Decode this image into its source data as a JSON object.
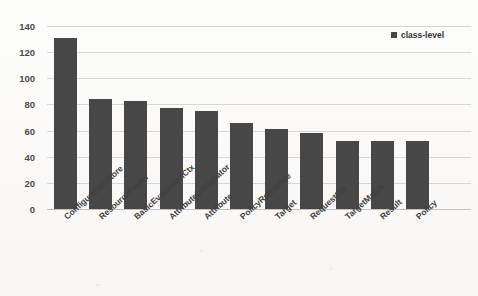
{
  "chart_data": {
    "type": "bar",
    "title": "",
    "subtitle": "",
    "xlabel": "",
    "ylabel": "",
    "categories": [
      "ConfigurationStore",
      "ResourceFinder",
      "BasicEvaluationCtx",
      "AttributeDesignator",
      "Attribute",
      "PolicyReference",
      "Target",
      "RequestCtx",
      "TargetMatch",
      "Result",
      "Policy"
    ],
    "series": [
      {
        "name": "class-level",
        "values": [
          131,
          84,
          83,
          77,
          75,
          66,
          61,
          58,
          52,
          52,
          52
        ],
        "color": "#474747"
      }
    ],
    "ylim": [
      0,
      140
    ],
    "yticks": [
      0,
      20,
      40,
      60,
      80,
      100,
      120,
      140
    ],
    "ytick_labels": [
      "0",
      "20",
      "40",
      "60",
      "80",
      "100",
      "120",
      "140"
    ],
    "grid": true,
    "grid_axis": "y",
    "legend": {
      "position": "top-right",
      "entries": [
        {
          "label": "class-level",
          "marker": "square",
          "color": "#474747"
        }
      ]
    },
    "xtick_rotation": -42,
    "background_color": "#faf9f8",
    "gridline_color": "#d6d6d6"
  },
  "legend": {
    "label": "class-level"
  },
  "artifacts": {
    "top_smudge_left": "",
    "top_smudge_mid": "",
    "top_smudge_right": ""
  }
}
